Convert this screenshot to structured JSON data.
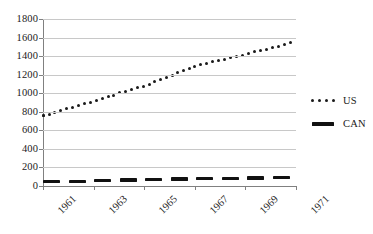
{
  "chart_data": {
    "type": "line",
    "title": "",
    "xlabel": "",
    "ylabel": "",
    "ylim": [
      0,
      1800
    ],
    "ytick_values": [
      0,
      200,
      400,
      600,
      800,
      1000,
      1200,
      1400,
      1600,
      1800
    ],
    "ytick_labels": [
      "0",
      "200",
      "400",
      "600",
      "800",
      "1000",
      "1200",
      "1400",
      "1600",
      "1800"
    ],
    "xtick_labels": [
      "1961",
      "1963",
      "1965",
      "1967",
      "1969",
      "1971"
    ],
    "xtick_values": [
      1961,
      1963,
      1965,
      1967,
      1969,
      1971
    ],
    "xlim": [
      1961,
      1971
    ],
    "grid": "horizontal",
    "legend_position": "right",
    "x": [
      1961.0,
      1961.25,
      1961.5,
      1961.75,
      1962.0,
      1962.25,
      1962.5,
      1962.75,
      1963.0,
      1963.25,
      1963.5,
      1963.75,
      1964.0,
      1964.25,
      1964.5,
      1964.75,
      1965.0,
      1965.25,
      1965.5,
      1965.75,
      1966.0,
      1966.25,
      1966.5,
      1966.75,
      1967.0,
      1967.25,
      1967.5,
      1967.75,
      1968.0,
      1968.25,
      1968.5,
      1968.75,
      1969.0,
      1969.25,
      1969.5,
      1969.75,
      1970.0,
      1970.25,
      1970.5,
      1970.75,
      1971.0
    ],
    "series": [
      {
        "name": "US",
        "style": "dotted",
        "color": "#1a1a1a",
        "values": [
          760,
          775,
          795,
          815,
          835,
          855,
          875,
          895,
          915,
          935,
          955,
          975,
          1000,
          1020,
          1040,
          1060,
          1080,
          1105,
          1130,
          1155,
          1180,
          1210,
          1240,
          1265,
          1290,
          1310,
          1325,
          1340,
          1355,
          1370,
          1385,
          1400,
          1420,
          1440,
          1455,
          1470,
          1485,
          1500,
          1520,
          1540,
          1560
        ]
      },
      {
        "name": "CAN",
        "style": "thick-dashed",
        "color": "#111111",
        "values": [
          45,
          46,
          47,
          48,
          50,
          51,
          52,
          54,
          55,
          57,
          58,
          60,
          61,
          63,
          64,
          66,
          67,
          69,
          70,
          72,
          73,
          75,
          76,
          77,
          78,
          79,
          80,
          81,
          82,
          83,
          84,
          85,
          86,
          87,
          88,
          89,
          90,
          91,
          92,
          93,
          95
        ]
      }
    ]
  },
  "legend": {
    "items": [
      {
        "label": "US",
        "marker": "dotted-line-marker"
      },
      {
        "label": "CAN",
        "marker": "solid-thick-line-marker"
      }
    ]
  }
}
